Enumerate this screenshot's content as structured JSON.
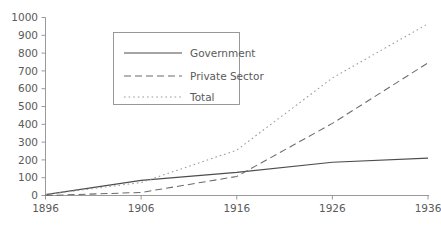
{
  "chart_data": {
    "type": "line",
    "title": "",
    "subtitle": "",
    "xlabel": "",
    "ylabel": "",
    "x": [
      1896,
      1906,
      1916,
      1926,
      1936
    ],
    "xlim": [
      1896,
      1936
    ],
    "ylim": [
      0,
      1000
    ],
    "grid": false,
    "legend_position": "upper-left-inset",
    "x_ticks": [
      "1896",
      "1906",
      "1916",
      "1926",
      "1936"
    ],
    "y_ticks": [
      "0",
      "100",
      "200",
      "300",
      "400",
      "500",
      "600",
      "700",
      "800",
      "900",
      "1000"
    ],
    "series": [
      {
        "name": "Government",
        "style": "solid",
        "color": "#4d4d4d",
        "values": [
          5,
          85,
          130,
          187,
          210
        ]
      },
      {
        "name": "Private Sector",
        "style": "dashed",
        "color": "#6b6b6b",
        "values": [
          0,
          17,
          107,
          405,
          745
        ]
      },
      {
        "name": "Total",
        "style": "dotted",
        "color": "#9a9a9a",
        "values": [
          5,
          73,
          255,
          660,
          965
        ]
      }
    ]
  },
  "axes": {
    "y_axis_name": "y-axis",
    "x_axis_name": "x-axis"
  },
  "legend": {
    "items": [
      {
        "label": "Government"
      },
      {
        "label": "Private Sector"
      },
      {
        "label": "Total"
      }
    ]
  },
  "colors": {
    "axis": "#8e8e8e",
    "text": "#5a5a5a",
    "background": "#ffffff"
  }
}
